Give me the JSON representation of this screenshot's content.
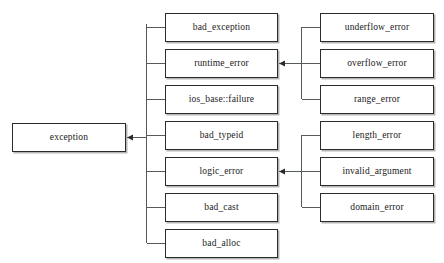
{
  "diagram": {
    "type": "class-inheritance-hierarchy",
    "title": "",
    "background_color": "#ffffff",
    "box_fill_color": "#ffffff",
    "box_border_color": "#2b2b2b",
    "connector_color": "#555a5e",
    "arrow_color": "#2b2b2b"
  },
  "root": {
    "label": "exception",
    "x": 12,
    "y": 123,
    "w": 114,
    "h": 29
  },
  "derived": [
    {
      "label": "bad_exception",
      "x": 165,
      "y": 13,
      "w": 113,
      "h": 29
    },
    {
      "label": "runtime_error",
      "x": 165,
      "y": 49,
      "w": 113,
      "h": 29
    },
    {
      "label": "ios_base::failure",
      "x": 165,
      "y": 85,
      "w": 113,
      "h": 29
    },
    {
      "label": "bad_typeid",
      "x": 165,
      "y": 121,
      "w": 113,
      "h": 29
    },
    {
      "label": "logic_error",
      "x": 165,
      "y": 157,
      "w": 113,
      "h": 29
    },
    {
      "label": "bad_cast",
      "x": 165,
      "y": 193,
      "w": 113,
      "h": 29
    },
    {
      "label": "bad_alloc",
      "x": 165,
      "y": 229,
      "w": 113,
      "h": 29
    }
  ],
  "runtime_children": [
    {
      "label": "underflow_error",
      "x": 320,
      "y": 13,
      "w": 114,
      "h": 29
    },
    {
      "label": "overflow_error",
      "x": 320,
      "y": 49,
      "w": 114,
      "h": 29
    },
    {
      "label": "range_error",
      "x": 320,
      "y": 85,
      "w": 114,
      "h": 29
    }
  ],
  "logic_children": [
    {
      "label": "length_error",
      "x": 320,
      "y": 121,
      "w": 114,
      "h": 29
    },
    {
      "label": "invalid_argument",
      "x": 320,
      "y": 157,
      "w": 114,
      "h": 29
    },
    {
      "label": "domain_error",
      "x": 320,
      "y": 193,
      "w": 114,
      "h": 29
    }
  ],
  "edges": {
    "root_trunk_x": 146,
    "root_trunk_top": 24,
    "root_trunk_bottom": 243,
    "root_arrow_y": 137,
    "runtime_trunk_x": 301,
    "runtime_trunk_top": 27,
    "runtime_trunk_bottom": 99,
    "runtime_arrow_y": 64,
    "logic_trunk_x": 301,
    "logic_trunk_top": 135,
    "logic_trunk_bottom": 207,
    "logic_arrow_y": 172
  }
}
